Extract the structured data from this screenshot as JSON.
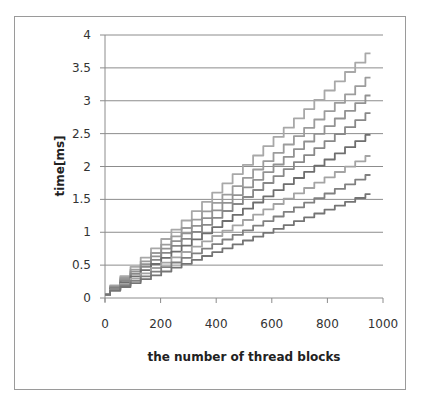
{
  "chart_data": {
    "type": "line",
    "title": "",
    "xlabel": "the number of thread blocks",
    "ylabel": "time[ms]",
    "xlim": [
      0,
      1000
    ],
    "ylim": [
      0,
      4
    ],
    "x_ticks": [
      "0",
      "200",
      "400",
      "600",
      "800",
      "1000"
    ],
    "y_ticks": [
      "0",
      "0.5",
      "1",
      "1.5",
      "2",
      "2.5",
      "3",
      "3.5",
      "4"
    ],
    "grid": "horizontal",
    "legend": "none",
    "note": "Nine staircase-shaped gray line series rising linearly from ~0.05 ms at x≈0 to different end values at x≈955",
    "x": [
      0,
      955
    ],
    "series": [
      {
        "name": "series1",
        "values": [
          0.05,
          3.72
        ],
        "color": "#a8a8a8"
      },
      {
        "name": "series2",
        "values": [
          0.05,
          3.35
        ],
        "color": "#9c9c9c"
      },
      {
        "name": "series3",
        "values": [
          0.05,
          3.08
        ],
        "color": "#929292"
      },
      {
        "name": "series4",
        "values": [
          0.05,
          2.81
        ],
        "color": "#888888"
      },
      {
        "name": "series5",
        "values": [
          0.05,
          2.48
        ],
        "color": "#6e6e6e"
      },
      {
        "name": "series6",
        "values": [
          0.05,
          2.16
        ],
        "color": "#a4a4a4"
      },
      {
        "name": "series7",
        "values": [
          0.05,
          1.87
        ],
        "color": "#808080"
      },
      {
        "name": "series8",
        "values": [
          0.05,
          1.58
        ],
        "color": "#747474"
      }
    ]
  }
}
